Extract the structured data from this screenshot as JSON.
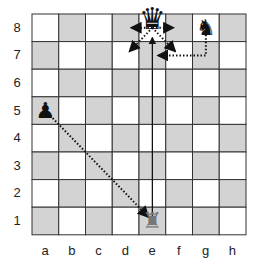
{
  "diagram": {
    "type": "chess-board",
    "board": {
      "left": 32,
      "top": 14,
      "cell_w": 26.75,
      "cell_h": 27.6,
      "light": "#ffffff",
      "dark": "#d3d3d3",
      "grid": "#333333"
    },
    "files": [
      "a",
      "b",
      "c",
      "d",
      "e",
      "f",
      "g",
      "h"
    ],
    "ranks": [
      "8",
      "7",
      "6",
      "5",
      "4",
      "3",
      "2",
      "1"
    ],
    "pieces": [
      {
        "square": "e8",
        "piece": "queen",
        "color": "black",
        "glyph": "♛"
      },
      {
        "square": "g8",
        "piece": "knight",
        "color": "black",
        "glyph": "♞"
      },
      {
        "square": "a5",
        "piece": "pawn",
        "color": "black",
        "glyph": "♟"
      },
      {
        "square": "e1",
        "piece": "rook",
        "color": "gray",
        "glyph": "♜"
      }
    ],
    "arrows": [
      {
        "from": "e8",
        "to": "d8",
        "style": "dotted"
      },
      {
        "from": "e8",
        "to": "f8",
        "style": "dotted"
      },
      {
        "from": "e8",
        "to": "d7",
        "style": "dotted"
      },
      {
        "from": "e8",
        "to": "f7",
        "style": "dotted"
      },
      {
        "from": "g8",
        "via": "g7",
        "to": "e7",
        "style": "dotted"
      },
      {
        "from": "a5",
        "to": "e1",
        "style": "dotted"
      },
      {
        "from": "e1",
        "to": "e8",
        "style": "solid"
      }
    ]
  }
}
